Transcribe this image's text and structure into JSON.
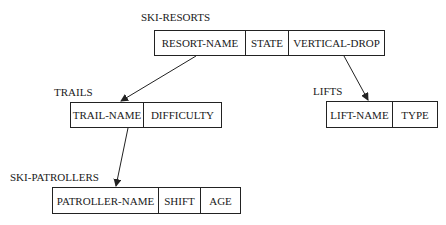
{
  "diagram": {
    "type": "hierarchical-record-structure",
    "records": [
      {
        "id": "ski-resorts",
        "name": "SKI-RESORTS",
        "fields": [
          "RESORT-NAME",
          "STATE",
          "VERTICAL-DROP"
        ]
      },
      {
        "id": "trails",
        "name": "TRAILS",
        "fields": [
          "TRAIL-NAME",
          "DIFFICULTY"
        ]
      },
      {
        "id": "lifts",
        "name": "LIFTS",
        "fields": [
          "LIFT-NAME",
          "TYPE"
        ]
      },
      {
        "id": "ski-patrollers",
        "name": "SKI-PATROLLERS",
        "fields": [
          "PATROLLER-NAME",
          "SHIFT",
          "AGE"
        ]
      }
    ],
    "edges": [
      {
        "from": "SKI-RESORTS",
        "to": "TRAILS"
      },
      {
        "from": "SKI-RESORTS",
        "to": "LIFTS"
      },
      {
        "from": "TRAILS",
        "to": "SKI-PATROLLERS"
      }
    ]
  },
  "colors": {
    "line": "#222222",
    "background": "#ffffff"
  }
}
